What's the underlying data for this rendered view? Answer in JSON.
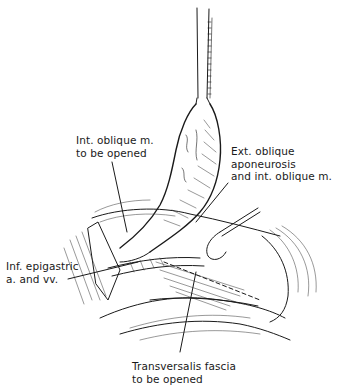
{
  "figure": {
    "labels": {
      "int_oblique": {
        "line1": "Int. oblique m.",
        "line2": "to be opened"
      },
      "ext_oblique": {
        "line1": "Ext. oblique",
        "line2": "aponeurosis",
        "line3": "and int. oblique m."
      },
      "inf_epigastric": {
        "line1": "Inf. epigastric",
        "line2": "a. and vv."
      },
      "transversalis": {
        "line1": "Transversalis fascia",
        "line2": "to be opened"
      }
    },
    "colors": {
      "ink": "#1a1a1a",
      "background": "#ffffff"
    }
  }
}
